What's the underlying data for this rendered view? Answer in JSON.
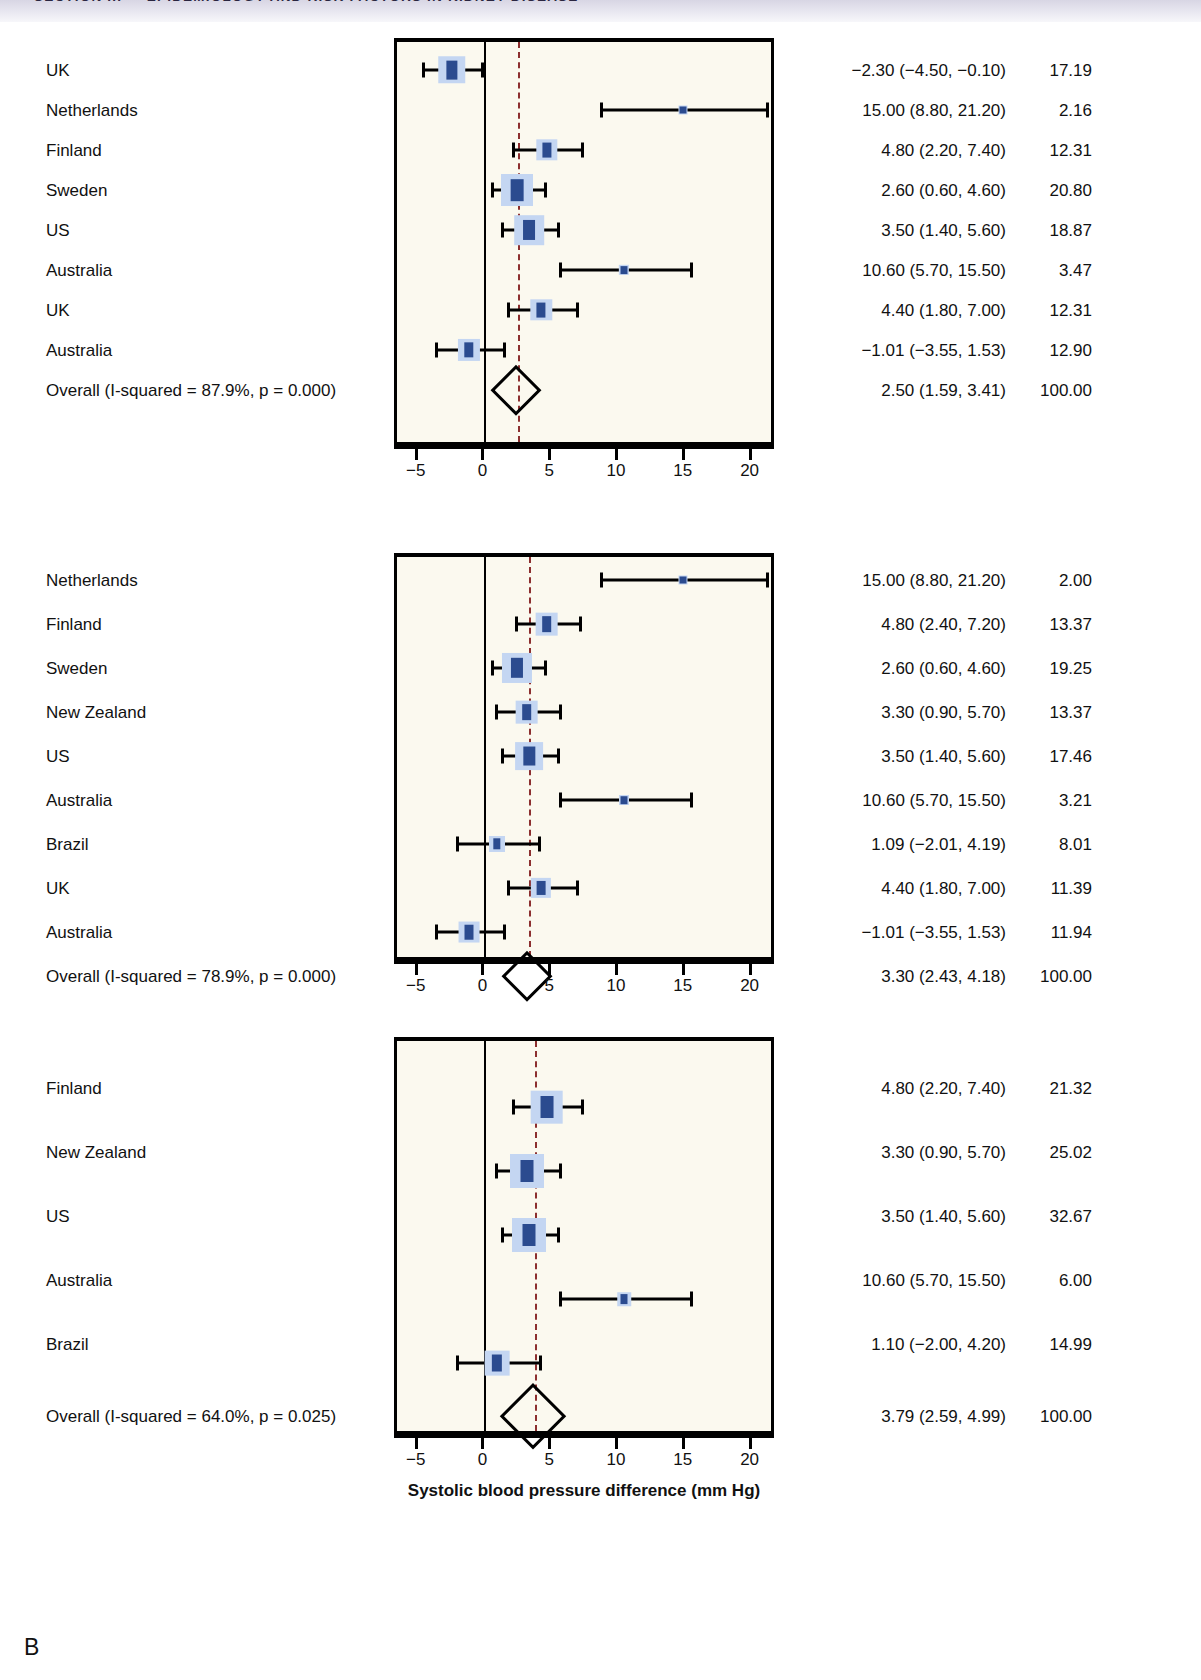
{
  "running_head": "SECTION III — EPIDEMIOLOGY AND RISK FACTORS IN KIDNEY DISEASE",
  "panel_letter": "B",
  "axis": {
    "title": "Systolic blood pressure difference (mm Hg)",
    "ticks": [
      "−5",
      "0",
      "5",
      "10",
      "15",
      "20"
    ],
    "tick_values": [
      -5,
      0,
      5,
      10,
      15,
      20
    ],
    "min": -6.4,
    "max": 21.6
  },
  "columns": {
    "study": "Study",
    "effect": "ES (95% CI)",
    "weight": "%Weight"
  },
  "chart_data": {
    "type": "forest",
    "xlabel": "Systolic blood pressure difference (mm Hg)",
    "ylabel": "",
    "xlim": [
      -6.4,
      21.6
    ],
    "xticks": [
      -5,
      0,
      5,
      10,
      15,
      20
    ],
    "grid": false,
    "legend": "none",
    "null_line": 0,
    "panels": [
      {
        "id": "panel-1",
        "heterogeneity": "Overall (I-squared = 87.9%, p = 0.000)",
        "i_squared": 87.9,
        "p_value": "0.000",
        "pooled_line": 2.5,
        "rows": [
          {
            "label": "UK",
            "effect": -2.3,
            "lower": -4.5,
            "upper": -0.1,
            "weight": 17.19,
            "effect_text": "−2.30 (−4.50, −0.10)",
            "weight_text": "17.19"
          },
          {
            "label": "Netherlands",
            "effect": 15.0,
            "lower": 8.8,
            "upper": 21.2,
            "weight": 2.16,
            "effect_text": "15.00 (8.80, 21.20)",
            "weight_text": "2.16"
          },
          {
            "label": "Finland",
            "effect": 4.8,
            "lower": 2.2,
            "upper": 7.4,
            "weight": 12.31,
            "effect_text": "4.80 (2.20, 7.40)",
            "weight_text": "12.31"
          },
          {
            "label": "Sweden",
            "effect": 2.6,
            "lower": 0.6,
            "upper": 4.6,
            "weight": 20.8,
            "effect_text": "2.60 (0.60, 4.60)",
            "weight_text": "20.80"
          },
          {
            "label": "US",
            "effect": 3.5,
            "lower": 1.4,
            "upper": 5.6,
            "weight": 18.87,
            "effect_text": "3.50 (1.40, 5.60)",
            "weight_text": "18.87"
          },
          {
            "label": "Australia",
            "effect": 10.6,
            "lower": 5.7,
            "upper": 15.5,
            "weight": 3.47,
            "effect_text": "10.60 (5.70, 15.50)",
            "weight_text": "3.47"
          },
          {
            "label": "UK",
            "effect": 4.4,
            "lower": 1.8,
            "upper": 7.0,
            "weight": 12.31,
            "effect_text": "4.40 (1.80, 7.00)",
            "weight_text": "12.31"
          },
          {
            "label": "Australia",
            "effect": -1.01,
            "lower": -3.55,
            "upper": 1.53,
            "weight": 12.9,
            "effect_text": "−1.01 (−3.55, 1.53)",
            "weight_text": "12.90"
          }
        ],
        "overall": {
          "label": "Overall (I-squared = 87.9%, p = 0.000)",
          "effect": 2.5,
          "lower": 1.59,
          "upper": 3.41,
          "weight": 100.0,
          "effect_text": "2.50 (1.59, 3.41)",
          "weight_text": "100.00"
        }
      },
      {
        "id": "panel-2",
        "heterogeneity": "Overall (I-squared = 78.9%, p = 0.000)",
        "i_squared": 78.9,
        "p_value": "0.000",
        "pooled_line": 3.3,
        "rows": [
          {
            "label": "Netherlands",
            "effect": 15.0,
            "lower": 8.8,
            "upper": 21.2,
            "weight": 2.0,
            "effect_text": "15.00 (8.80, 21.20)",
            "weight_text": "2.00"
          },
          {
            "label": "Finland",
            "effect": 4.8,
            "lower": 2.4,
            "upper": 7.2,
            "weight": 13.37,
            "effect_text": "4.80 (2.40, 7.20)",
            "weight_text": "13.37"
          },
          {
            "label": "Sweden",
            "effect": 2.6,
            "lower": 0.6,
            "upper": 4.6,
            "weight": 19.25,
            "effect_text": "2.60 (0.60, 4.60)",
            "weight_text": "19.25"
          },
          {
            "label": "New Zealand",
            "effect": 3.3,
            "lower": 0.9,
            "upper": 5.7,
            "weight": 13.37,
            "effect_text": "3.30 (0.90, 5.70)",
            "weight_text": "13.37"
          },
          {
            "label": "US",
            "effect": 3.5,
            "lower": 1.4,
            "upper": 5.6,
            "weight": 17.46,
            "effect_text": "3.50 (1.40, 5.60)",
            "weight_text": "17.46"
          },
          {
            "label": "Australia",
            "effect": 10.6,
            "lower": 5.7,
            "upper": 15.5,
            "weight": 3.21,
            "effect_text": "10.60 (5.70, 15.50)",
            "weight_text": "3.21"
          },
          {
            "label": "Brazil",
            "effect": 1.09,
            "lower": -2.01,
            "upper": 4.19,
            "weight": 8.01,
            "effect_text": "1.09 (−2.01, 4.19)",
            "weight_text": "8.01"
          },
          {
            "label": "UK",
            "effect": 4.4,
            "lower": 1.8,
            "upper": 7.0,
            "weight": 11.39,
            "effect_text": "4.40 (1.80, 7.00)",
            "weight_text": "11.39"
          },
          {
            "label": "Australia",
            "effect": -1.01,
            "lower": -3.55,
            "upper": 1.53,
            "weight": 11.94,
            "effect_text": "−1.01 (−3.55, 1.53)",
            "weight_text": "11.94"
          }
        ],
        "overall": {
          "label": "Overall (I-squared = 78.9%, p = 0.000)",
          "effect": 3.3,
          "lower": 2.43,
          "upper": 4.18,
          "weight": 100.0,
          "effect_text": "3.30 (2.43, 4.18)",
          "weight_text": "100.00"
        }
      },
      {
        "id": "panel-3",
        "heterogeneity": "Overall (I-squared = 64.0%, p = 0.025)",
        "i_squared": 64.0,
        "p_value": "0.025",
        "pooled_line": 3.79,
        "rows": [
          {
            "label": "Finland",
            "effect": 4.8,
            "lower": 2.2,
            "upper": 7.4,
            "weight": 21.32,
            "effect_text": "4.80 (2.20, 7.40)",
            "weight_text": "21.32"
          },
          {
            "label": "New Zealand",
            "effect": 3.3,
            "lower": 0.9,
            "upper": 5.7,
            "weight": 25.02,
            "effect_text": "3.30 (0.90, 5.70)",
            "weight_text": "25.02"
          },
          {
            "label": "US",
            "effect": 3.5,
            "lower": 1.4,
            "upper": 5.6,
            "weight": 32.67,
            "effect_text": "3.50 (1.40, 5.60)",
            "weight_text": "32.67"
          },
          {
            "label": "Australia",
            "effect": 10.6,
            "lower": 5.7,
            "upper": 15.5,
            "weight": 6.0,
            "effect_text": "10.60 (5.70, 15.50)",
            "weight_text": "6.00"
          },
          {
            "label": "Brazil",
            "effect": 1.1,
            "lower": -2.0,
            "upper": 4.2,
            "weight": 14.99,
            "effect_text": "1.10 (−2.00, 4.20)",
            "weight_text": "14.99"
          }
        ],
        "overall": {
          "label": "Overall (I-squared = 64.0%, p = 0.025)",
          "effect": 3.79,
          "lower": 2.59,
          "upper": 4.99,
          "weight": 100.0,
          "effect_text": "3.79 (2.59, 4.99)",
          "weight_text": "100.00"
        }
      }
    ]
  }
}
